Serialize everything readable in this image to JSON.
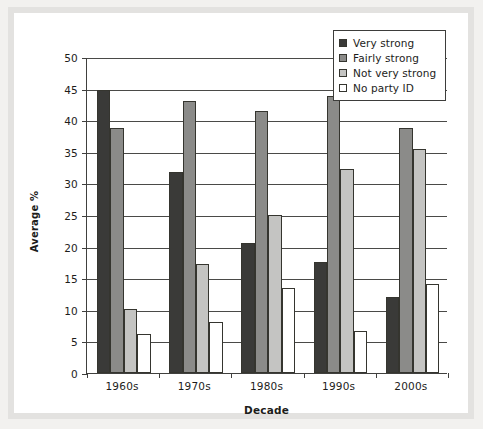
{
  "chart_data": {
    "type": "bar",
    "title": "",
    "xlabel": "Decade",
    "ylabel": "Average %",
    "ylim": [
      0,
      50
    ],
    "ytick_step": 5,
    "yticks": [
      "0",
      "5",
      "10",
      "15",
      "20",
      "25",
      "30",
      "35",
      "40",
      "45",
      "50"
    ],
    "grid": true,
    "legend_position": "top-right",
    "categories": [
      "1960s",
      "1970s",
      "1980s",
      "1990s",
      "2000s"
    ],
    "series": [
      {
        "name": "Very strong",
        "color": "#3a3a38",
        "values": [
          44.8,
          31.8,
          20.6,
          17.6,
          12.0
        ]
      },
      {
        "name": "Fairly strong",
        "color": "#8b8b89",
        "values": [
          38.7,
          43.0,
          41.5,
          43.8,
          38.8
        ]
      },
      {
        "name": "Not very strong",
        "color": "#c4c4c2",
        "values": [
          10.2,
          17.2,
          25.0,
          32.3,
          35.4
        ]
      },
      {
        "name": "No party ID",
        "color": "#ffffff",
        "values": [
          6.2,
          8.0,
          13.5,
          6.6,
          14.1
        ]
      }
    ]
  },
  "legend": {
    "items": [
      {
        "label": "Very strong"
      },
      {
        "label": "Fairly strong"
      },
      {
        "label": "Not very strong"
      },
      {
        "label": "No party ID"
      }
    ]
  },
  "axes": {
    "y_title": "Average %",
    "x_title": "Decade"
  },
  "colors": {
    "page_background": "#f2f1ef",
    "frame": "#e3e2e0",
    "plot_background": "#ffffff",
    "axis": "#40403e",
    "gridline": "#4a4a48",
    "text": "#1d1d1b"
  }
}
